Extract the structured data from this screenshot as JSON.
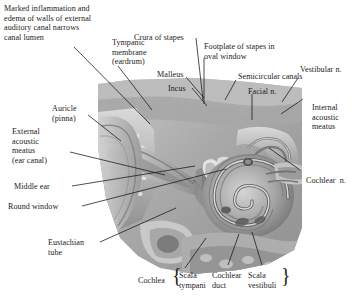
{
  "figure": {
    "type": "anatomical-cross-section",
    "colors": {
      "text": "#1b1b1b",
      "leader_line": "#111111",
      "background": "#ffffff"
    }
  },
  "labels": {
    "marked_inflammation": "Marked inflammation and\nedema of walls of external\nauditory canal narrows\ncanal lumen",
    "tympanic_membrane": "Tympanic\nmembrane\n(eardrum)",
    "crura_of_stapes": "Crura of stapes",
    "footplate_of_stapes": "Footplate of stapes in\noval window",
    "malleus": "Malleus",
    "incus": "Incus",
    "semicircular_canals": "Semicircular canals",
    "facial_n": "Facial n.",
    "vestibular_n": "Vestibular n.",
    "internal_acoustic_meatus": "Internal\nacoustic\nmeatus",
    "auricle": "Auricle\n(pinna)",
    "external_acoustic_meatus": "External\nacoustic\nmeatus\n(ear canal)",
    "middle_ear": "Middle ear",
    "round_window": "Round window",
    "eustachian_tube": "Eustachian\ntube",
    "cochlear_n": "Cochlear  n.",
    "cochlea": "Cochlea",
    "scala_tympani": "Scala\ntympani",
    "cochlear_duct": "Cochlear\nduct",
    "scala_vestibuli": "Scala\nvestibuli",
    "brace_open": "{",
    "brace_close": "}"
  }
}
